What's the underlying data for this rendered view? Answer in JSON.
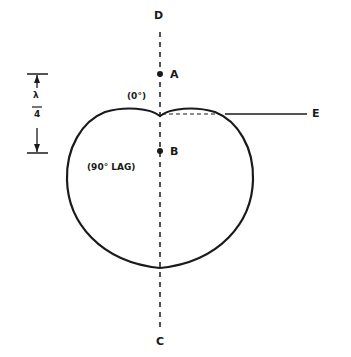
{
  "diagram": {
    "type": "cardioid radiation pattern",
    "axis_labels": {
      "top": "D",
      "bottom": "C",
      "right_pointer": "E"
    },
    "points": [
      {
        "name": "A",
        "label": "A"
      },
      {
        "name": "B",
        "label": "B"
      }
    ],
    "phase_labels": {
      "element_a": "(0°)",
      "element_b": "(90° LAG)"
    },
    "spacing": {
      "numerator": "λ",
      "denominator": "4"
    },
    "colors": {
      "stroke": "#1a1a1a",
      "background": "#ffffff"
    }
  }
}
